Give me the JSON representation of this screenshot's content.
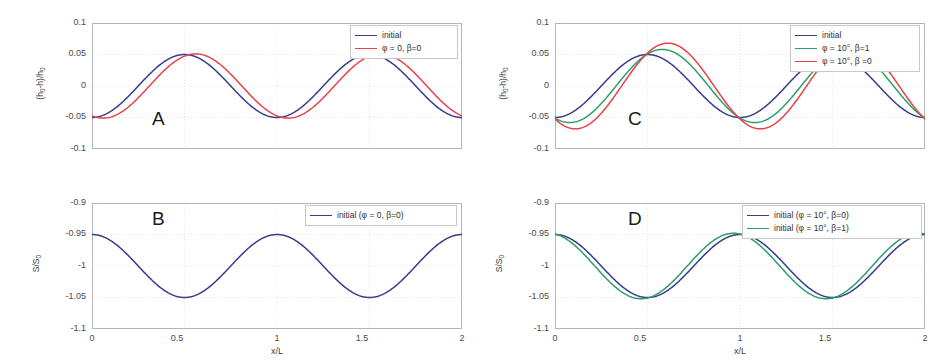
{
  "figure": {
    "panels": [
      {
        "letter": "A",
        "xlabel": "",
        "ylabel": "(h0-h)/h0",
        "xticks": [
          "0",
          "0.5",
          "1",
          "1.5",
          "2"
        ],
        "yticks": [
          "0.1",
          "0.05",
          "0",
          "-0.05",
          "-0.1"
        ],
        "legend": [
          {
            "label": "initial",
            "color": "#3a3a8c"
          },
          {
            "label": "φ = 0, β=0",
            "color": "#e8424a"
          }
        ]
      },
      {
        "letter": "B",
        "xlabel": "x/L",
        "ylabel": "S/S0",
        "xticks": [
          "0",
          "0.5",
          "1",
          "1.5",
          "2"
        ],
        "yticks": [
          "-0.9",
          "-0.95",
          "-1",
          "-1.05",
          "-1.1"
        ],
        "legend": [
          {
            "label": "initial (φ = 0, β=0)",
            "color": "#3a3a8c"
          }
        ]
      },
      {
        "letter": "C",
        "xlabel": "",
        "ylabel": "(h0-h)/h0",
        "xticks": [
          "0",
          "0.5",
          "1",
          "1.5",
          "2"
        ],
        "yticks": [
          "0.1",
          "0.05",
          "0",
          "-0.05",
          "-0.1"
        ],
        "legend": [
          {
            "label": "initial",
            "color": "#3a3a8c"
          },
          {
            "label": "φ = 10°, β=1",
            "color": "#2e9e6b"
          },
          {
            "label": "φ = 10°, β =0",
            "color": "#e8424a"
          }
        ]
      },
      {
        "letter": "D",
        "xlabel": "x/L",
        "ylabel": "S/S0",
        "xticks": [
          "0",
          "0.5",
          "1",
          "1.5",
          "2"
        ],
        "yticks": [
          "-0.9",
          "-0.95",
          "-1",
          "-1.05",
          "-1.1"
        ],
        "legend": [
          {
            "label": "initial (φ = 10°, β=0)",
            "color": "#3a3a8c"
          },
          {
            "label": "initial (φ = 10°, β=1)",
            "color": "#2e9e6b"
          }
        ]
      }
    ]
  },
  "colors": {
    "blue": "#3a3a8c",
    "red": "#e8424a",
    "green": "#2e9e6b",
    "grid": "#d9d9d9",
    "frame": "#b5b5b5"
  },
  "chart_data": [
    {
      "type": "line",
      "panel": "A",
      "title": "",
      "xlabel": "x/L",
      "ylabel": "(h0-h)/h0",
      "xlim": [
        0,
        2
      ],
      "ylim": [
        -0.1,
        0.1
      ],
      "xticks": [
        0,
        0.5,
        1,
        1.5,
        2
      ],
      "yticks": [
        -0.1,
        -0.05,
        0,
        0.05,
        0.1
      ],
      "grid": true,
      "legend_position": "top-right",
      "series": [
        {
          "name": "initial",
          "color": "#3a3a8c",
          "form": "-0.05*cos(2*pi*x)",
          "amplitude": 0.05,
          "phase_shift": 0.0,
          "periods": 2,
          "x": [
            0,
            0.125,
            0.25,
            0.375,
            0.5,
            0.625,
            0.75,
            0.875,
            1,
            1.125,
            1.25,
            1.375,
            1.5,
            1.625,
            1.75,
            1.875,
            2
          ],
          "y": [
            -0.05,
            -0.035,
            0,
            0.035,
            0.05,
            0.035,
            0,
            -0.035,
            -0.05,
            -0.035,
            0,
            0.035,
            0.05,
            0.035,
            0,
            -0.035,
            -0.05
          ]
        },
        {
          "name": "φ = 0, β=0",
          "color": "#e8424a",
          "form": "-0.05*cos(2*pi*(x+0.06))",
          "amplitude": 0.051,
          "phase_shift": -0.06,
          "periods": 2,
          "x": [
            0,
            0.125,
            0.25,
            0.375,
            0.5,
            0.625,
            0.75,
            0.875,
            1,
            1.125,
            1.25,
            1.375,
            1.5,
            1.625,
            1.75,
            1.875,
            2
          ],
          "y": [
            -0.041,
            -0.016,
            0.019,
            0.046,
            0.05,
            0.028,
            -0.008,
            -0.04,
            -0.051,
            -0.041,
            -0.016,
            0.019,
            0.046,
            0.05,
            0.028,
            -0.008,
            -0.051
          ]
        }
      ]
    },
    {
      "type": "line",
      "panel": "B",
      "title": "",
      "xlabel": "x/L",
      "ylabel": "S/S0",
      "xlim": [
        0,
        2
      ],
      "ylim": [
        -1.1,
        -0.9
      ],
      "xticks": [
        0,
        0.5,
        1,
        1.5,
        2
      ],
      "yticks": [
        -1.1,
        -1.05,
        -1,
        -0.95,
        -0.9
      ],
      "grid": true,
      "legend_position": "top-right",
      "series": [
        {
          "name": "initial (φ = 0, β=0)",
          "color": "#3a3a8c",
          "form": "-1 + 0.05*cos(2*pi*x)",
          "amplitude": 0.05,
          "phase_shift": 0.0,
          "periods": 2,
          "x": [
            0,
            0.125,
            0.25,
            0.375,
            0.5,
            0.625,
            0.75,
            0.875,
            1,
            1.125,
            1.25,
            1.375,
            1.5,
            1.625,
            1.75,
            1.875,
            2
          ],
          "y": [
            -0.95,
            -0.965,
            -1,
            -1.035,
            -1.05,
            -1.035,
            -1,
            -0.965,
            -0.95,
            -0.965,
            -1,
            -1.035,
            -1.05,
            -1.035,
            -1,
            -0.965,
            -0.95
          ]
        }
      ]
    },
    {
      "type": "line",
      "panel": "C",
      "title": "",
      "xlabel": "x/L",
      "ylabel": "(h0-h)/h0",
      "xlim": [
        0,
        2
      ],
      "ylim": [
        -0.1,
        0.1
      ],
      "xticks": [
        0,
        0.5,
        1,
        1.5,
        2
      ],
      "yticks": [
        -0.1,
        -0.05,
        0,
        0.05,
        0.1
      ],
      "grid": true,
      "legend_position": "top-right",
      "series": [
        {
          "name": "initial",
          "color": "#3a3a8c",
          "form": "-0.05*cos(2*pi*x)",
          "amplitude": 0.05,
          "phase_shift": 0.0,
          "periods": 2,
          "x": [
            0,
            0.125,
            0.25,
            0.375,
            0.5,
            0.625,
            0.75,
            0.875,
            1,
            1.125,
            1.25,
            1.375,
            1.5,
            1.625,
            1.75,
            1.875,
            2
          ],
          "y": [
            -0.05,
            -0.035,
            0,
            0.035,
            0.05,
            0.035,
            0,
            -0.035,
            -0.05,
            -0.035,
            0,
            0.035,
            0.05,
            0.035,
            0,
            -0.035,
            -0.05
          ]
        },
        {
          "name": "φ = 10°, β=1",
          "color": "#2e9e6b",
          "form": "-0.058*cos(2*pi*(x+0.08))",
          "amplitude": 0.058,
          "phase_shift": -0.08,
          "periods": 2,
          "x": [
            0,
            0.125,
            0.25,
            0.375,
            0.5,
            0.625,
            0.75,
            0.875,
            1,
            1.125,
            1.25,
            1.375,
            1.5,
            1.625,
            1.75,
            1.875,
            2
          ],
          "y": [
            -0.05,
            -0.008,
            0.03,
            0.057,
            0.052,
            0.018,
            -0.022,
            -0.052,
            -0.056,
            -0.035,
            0.005,
            0.042,
            0.058,
            0.04,
            0.003,
            -0.034,
            -0.056
          ]
        },
        {
          "name": "φ = 10°, β =0",
          "color": "#e8424a",
          "form": "-0.068*cos(2*pi*(x+0.11))",
          "amplitude": 0.068,
          "phase_shift": -0.11,
          "periods": 2,
          "x": [
            0,
            0.125,
            0.25,
            0.375,
            0.5,
            0.625,
            0.75,
            0.875,
            1,
            1.125,
            1.25,
            1.375,
            1.5,
            1.625,
            1.75,
            1.875,
            2
          ],
          "y": [
            -0.052,
            0.005,
            0.048,
            0.068,
            0.048,
            0.005,
            -0.04,
            -0.066,
            -0.06,
            -0.02,
            0.03,
            0.064,
            0.062,
            0.028,
            -0.02,
            -0.058,
            -0.068
          ]
        }
      ]
    },
    {
      "type": "line",
      "panel": "D",
      "title": "",
      "xlabel": "x/L",
      "ylabel": "S/S0",
      "xlim": [
        0,
        2
      ],
      "ylim": [
        -1.1,
        -0.9
      ],
      "xticks": [
        0,
        0.5,
        1,
        1.5,
        2
      ],
      "yticks": [
        -1.1,
        -1.05,
        -1,
        -0.95,
        -0.9
      ],
      "grid": true,
      "legend_position": "top-right",
      "series": [
        {
          "name": "initial (φ = 10°, β=0)",
          "color": "#3a3a8c",
          "form": "-1 + 0.05*cos(2*pi*x)",
          "amplitude": 0.05,
          "phase_shift": 0.0,
          "periods": 2,
          "x": [
            0,
            0.125,
            0.25,
            0.375,
            0.5,
            0.625,
            0.75,
            0.875,
            1,
            1.125,
            1.25,
            1.375,
            1.5,
            1.625,
            1.75,
            1.875,
            2
          ],
          "y": [
            -0.952,
            -0.967,
            -1,
            -1.033,
            -1.05,
            -1.035,
            -1,
            -0.966,
            -0.951,
            -0.966,
            -1,
            -1.034,
            -1.05,
            -1.034,
            -1,
            -0.966,
            -0.952
          ]
        },
        {
          "name": "initial (φ = 10°, β=1)",
          "color": "#2e9e6b",
          "form": "-1 + 0.052*cos(2*pi*(x-0.035))",
          "amplitude": 0.052,
          "phase_shift": 0.035,
          "periods": 2,
          "x": [
            0,
            0.125,
            0.25,
            0.375,
            0.5,
            0.625,
            0.75,
            0.875,
            1,
            1.125,
            1.25,
            1.375,
            1.5,
            1.625,
            1.75,
            1.875,
            2
          ],
          "y": [
            -0.949,
            -0.955,
            -0.985,
            -1.022,
            -1.048,
            -1.046,
            -1.015,
            -0.977,
            -0.95,
            -0.953,
            -0.983,
            -1.02,
            -1.047,
            -1.046,
            -1.016,
            -0.978,
            -0.949
          ]
        }
      ]
    }
  ]
}
